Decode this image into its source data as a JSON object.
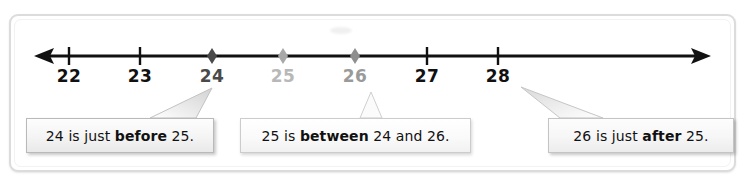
{
  "figure": {
    "type": "number-line-diagram",
    "title": "",
    "colors": {
      "black": "#111111",
      "dark_gray": "#555555",
      "mid_gray": "#8f8f8f",
      "light_gray": "#b8b8b8",
      "card_border": "#dcdcdc",
      "callout_border": "#b9b9b9"
    }
  },
  "numberline": {
    "left_arrow": "left-arrow",
    "right_arrow": "right-arrow",
    "axis_min": 22,
    "axis_max": 28,
    "ticks": [
      {
        "value": "22",
        "x": 69,
        "color": "#111111",
        "marker": "tick",
        "marker_color": "#111111"
      },
      {
        "value": "23",
        "x": 140,
        "color": "#111111",
        "marker": "tick",
        "marker_color": "#111111"
      },
      {
        "value": "24",
        "x": 212,
        "color": "#4a4a4a",
        "marker": "diamond",
        "marker_color": "#4a4a4a"
      },
      {
        "value": "25",
        "x": 283,
        "color": "#b8b8b8",
        "marker": "diamond",
        "marker_color": "#a8a8a8"
      },
      {
        "value": "26",
        "x": 355,
        "color": "#9a9a9a",
        "marker": "diamond",
        "marker_color": "#8f8f8f"
      },
      {
        "value": "27",
        "x": 427,
        "color": "#111111",
        "marker": "tick",
        "marker_color": "#111111"
      },
      {
        "value": "28",
        "x": 498,
        "color": "#111111",
        "marker": "tick",
        "marker_color": "#111111"
      }
    ]
  },
  "callouts": [
    {
      "id": "callout-1",
      "full_text": "24 is just before 25.",
      "pre": "24 is just ",
      "emphasis": "before",
      "post": " 25.",
      "points_to": "24"
    },
    {
      "id": "callout-2",
      "full_text": "25 is between 24 and 26.",
      "pre": "25 is ",
      "emphasis": "between",
      "post": " 24 and 26.",
      "points_to": "25"
    },
    {
      "id": "callout-3",
      "full_text": "26 is just after 25.",
      "pre": "26 is just ",
      "emphasis": "after",
      "post": " 25.",
      "points_to": "26"
    }
  ]
}
